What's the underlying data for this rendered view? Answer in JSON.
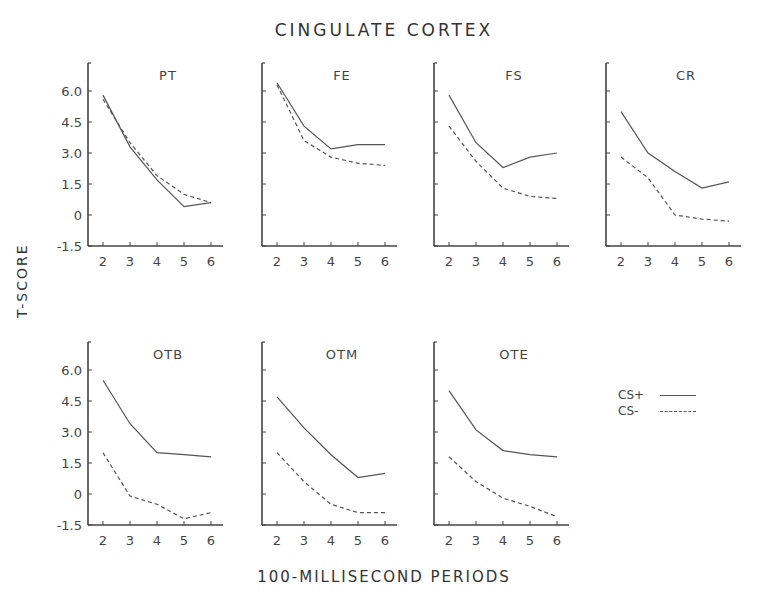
{
  "figure": {
    "title": "CINGULATE CORTEX",
    "ylabel": "T-SCORE",
    "xlabel": "100-MILLISECOND PERIODS",
    "legend": [
      {
        "label": "CS+",
        "style": "solid"
      },
      {
        "label": "CS-",
        "style": "dashed"
      }
    ],
    "line_color": "#555555"
  },
  "chart_data": [
    {
      "type": "line",
      "title": "PT",
      "x": [
        2,
        3,
        4,
        5,
        6
      ],
      "xlabel": "100-MILLISECOND PERIODS",
      "ylabel": "T-SCORE",
      "yticks": [
        "-1.5",
        "0",
        "1.5",
        "3.0",
        "4.5",
        "6.0"
      ],
      "ylim": [
        -1.5,
        7.5
      ],
      "grid": false,
      "series": [
        {
          "name": "CS+",
          "values": [
            5.8,
            3.3,
            1.7,
            0.4,
            0.6
          ]
        },
        {
          "name": "CS-",
          "values": [
            5.6,
            3.5,
            1.9,
            1.0,
            0.6
          ]
        }
      ]
    },
    {
      "type": "line",
      "title": "FE",
      "x": [
        2,
        3,
        4,
        5,
        6
      ],
      "ylim": [
        -1.5,
        7.5
      ],
      "series": [
        {
          "name": "CS+",
          "values": [
            6.4,
            4.3,
            3.2,
            3.4,
            3.4
          ]
        },
        {
          "name": "CS-",
          "values": [
            6.3,
            3.6,
            2.8,
            2.5,
            2.4
          ]
        }
      ]
    },
    {
      "type": "line",
      "title": "FS",
      "x": [
        2,
        3,
        4,
        5,
        6
      ],
      "ylim": [
        -1.5,
        7.5
      ],
      "series": [
        {
          "name": "CS+",
          "values": [
            5.8,
            3.5,
            2.3,
            2.8,
            3.0
          ]
        },
        {
          "name": "CS-",
          "values": [
            4.3,
            2.6,
            1.3,
            0.9,
            0.8
          ]
        }
      ]
    },
    {
      "type": "line",
      "title": "CR",
      "x": [
        2,
        3,
        4,
        5,
        6
      ],
      "ylim": [
        -1.5,
        7.5
      ],
      "series": [
        {
          "name": "CS+",
          "values": [
            5.0,
            3.0,
            2.1,
            1.3,
            1.6
          ]
        },
        {
          "name": "CS-",
          "values": [
            2.8,
            1.8,
            0.0,
            -0.2,
            -0.3
          ]
        }
      ]
    },
    {
      "type": "line",
      "title": "OTB",
      "x": [
        2,
        3,
        4,
        5,
        6
      ],
      "xlabel": "100-MILLISECOND PERIODS",
      "ylabel": "T-SCORE",
      "yticks": [
        "-1.5",
        "0",
        "1.5",
        "3.0",
        "4.5",
        "6.0"
      ],
      "ylim": [
        -1.5,
        7.5
      ],
      "series": [
        {
          "name": "CS+",
          "values": [
            5.5,
            3.4,
            2.0,
            1.9,
            1.8
          ]
        },
        {
          "name": "CS-",
          "values": [
            2.0,
            -0.1,
            -0.5,
            -1.2,
            -0.9
          ]
        }
      ]
    },
    {
      "type": "line",
      "title": "OTM",
      "x": [
        2,
        3,
        4,
        5,
        6
      ],
      "ylim": [
        -1.5,
        7.5
      ],
      "series": [
        {
          "name": "CS+",
          "values": [
            4.7,
            3.2,
            1.9,
            0.8,
            1.0
          ]
        },
        {
          "name": "CS-",
          "values": [
            2.0,
            0.6,
            -0.5,
            -0.9,
            -0.9
          ]
        }
      ]
    },
    {
      "type": "line",
      "title": "OTE",
      "x": [
        2,
        3,
        4,
        5,
        6
      ],
      "ylim": [
        -1.5,
        7.5
      ],
      "series": [
        {
          "name": "CS+",
          "values": [
            5.0,
            3.1,
            2.1,
            1.9,
            1.8
          ]
        },
        {
          "name": "CS-",
          "values": [
            1.8,
            0.6,
            -0.2,
            -0.6,
            -1.1
          ]
        }
      ]
    }
  ],
  "layout": {
    "panels": [
      {
        "axis_x": 88,
        "top": 63,
        "show_ylabels": true
      },
      {
        "axis_x": 262,
        "top": 63,
        "show_ylabels": false
      },
      {
        "axis_x": 434,
        "top": 63,
        "show_ylabels": false
      },
      {
        "axis_x": 606,
        "top": 63,
        "show_ylabels": false
      },
      {
        "axis_x": 88,
        "top": 342,
        "show_ylabels": true
      },
      {
        "axis_x": 262,
        "top": 342,
        "show_ylabels": false
      },
      {
        "axis_x": 434,
        "top": 342,
        "show_ylabels": false
      }
    ]
  }
}
